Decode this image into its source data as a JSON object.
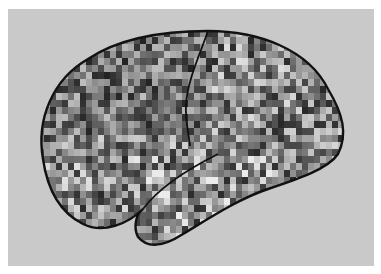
{
  "image": {
    "subject": "lateral view of brain with pixelated grayscale mosaic and traced outline",
    "background_color": "#c9c9c9",
    "frame_color": "#ffffff",
    "outline_color": "#111111",
    "mosaic": {
      "cell_w": 6,
      "cell_h": 7,
      "gray_min": 40,
      "gray_max": 225,
      "seed": 7
    }
  }
}
